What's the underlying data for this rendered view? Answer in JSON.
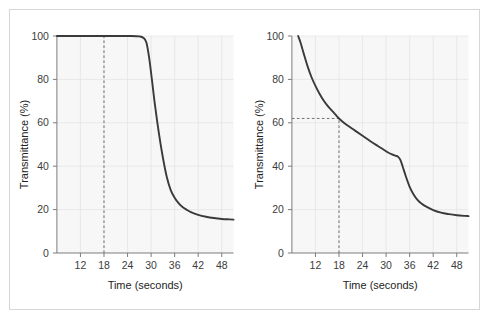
{
  "figure": {
    "background": "#ffffff",
    "frame_color": "#d6d6d6",
    "plot_background": "#f7f7f7",
    "grid_color": "#e2e2e2",
    "curve_color": "#3a3a3a",
    "axis_color": "#7a7a7a",
    "annotation_color": "#6e6e6e"
  },
  "chart_data": [
    {
      "type": "line",
      "panel": "left",
      "title": "",
      "xlabel": "Time (seconds)",
      "ylabel": "Transmittance (%)",
      "xlim": [
        6,
        51
      ],
      "ylim": [
        0,
        100
      ],
      "xticks": [
        12,
        18,
        24,
        30,
        36,
        42,
        48
      ],
      "xtick_labels": [
        "12",
        "18",
        "24",
        "30",
        "36",
        "42",
        "48"
      ],
      "yticks": [
        0,
        20,
        40,
        60,
        80,
        100
      ],
      "ytick_labels": [
        "0",
        "20",
        "40",
        "60",
        "80",
        "100"
      ],
      "grid": true,
      "legend": "none",
      "annotations": [
        {
          "kind": "vertical-dashed-line",
          "x": 18,
          "y_from": 0,
          "y_to": 100,
          "label": ""
        }
      ],
      "series": [
        {
          "name": "transmittance",
          "x": [
            6,
            10,
            14,
            18,
            22,
            25,
            27,
            28,
            28.8,
            29.5,
            30.2,
            31,
            32,
            33,
            34,
            35,
            36,
            37,
            38,
            39,
            40,
            42,
            44,
            46,
            48,
            50,
            51
          ],
          "y": [
            100,
            100,
            100,
            100,
            100,
            100,
            99.8,
            99.2,
            97,
            90,
            80,
            68,
            55,
            44,
            35,
            29,
            25.5,
            23,
            21.2,
            20,
            19,
            17.6,
            16.7,
            16.1,
            15.7,
            15.5,
            15.4
          ]
        }
      ]
    },
    {
      "type": "line",
      "panel": "right",
      "title": "",
      "xlabel": "Time (seconds)",
      "ylabel": "Transmittance (%)",
      "xlim": [
        6,
        51
      ],
      "ylim": [
        0,
        100
      ],
      "xticks": [
        12,
        18,
        24,
        30,
        36,
        42,
        48
      ],
      "xtick_labels": [
        "12",
        "18",
        "24",
        "30",
        "36",
        "42",
        "48"
      ],
      "yticks": [
        0,
        20,
        40,
        60,
        80,
        100
      ],
      "ytick_labels": [
        "0",
        "20",
        "40",
        "60",
        "80",
        "100"
      ],
      "grid": true,
      "legend": "none",
      "annotations": [
        {
          "kind": "vertical-dashed-line",
          "x": 18,
          "y_from": 0,
          "y_to": 62,
          "label": ""
        },
        {
          "kind": "horizontal-dashed-line",
          "y": 62,
          "x_from": 6,
          "x_to": 18,
          "label": ""
        }
      ],
      "series": [
        {
          "name": "transmittance",
          "x": [
            7.6,
            8.2,
            9,
            10,
            11,
            12,
            13,
            14,
            15,
            16,
            17,
            18,
            19,
            20,
            22,
            24,
            26,
            28,
            29.5,
            30.5,
            31.5,
            32.5,
            33,
            33.6,
            34.2,
            35,
            36,
            37,
            38,
            39,
            40,
            42,
            44,
            46,
            48,
            50,
            51
          ],
          "y": [
            100,
            97,
            92,
            86,
            81,
            77,
            73.5,
            70.5,
            68,
            66,
            64,
            62,
            60.4,
            59,
            56.5,
            54,
            51.5,
            49.2,
            47.5,
            46.3,
            45.4,
            44.8,
            44.4,
            43,
            40,
            35.5,
            30.5,
            27,
            24.5,
            22.8,
            21.6,
            19.8,
            18.6,
            17.9,
            17.4,
            17.1,
            17
          ]
        }
      ]
    }
  ]
}
